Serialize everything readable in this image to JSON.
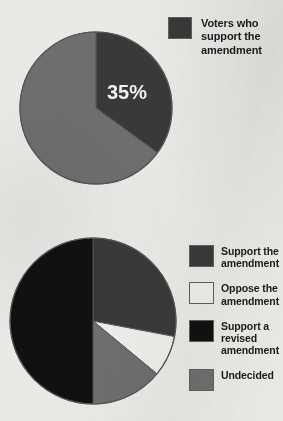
{
  "page": {
    "background_color": "#e9e9e6",
    "width": 283,
    "height": 421
  },
  "palette": {
    "dark_gray": "#393939",
    "mid_gray": "#6e6e6e",
    "near_black": "#111111",
    "off_white": "#ededea",
    "stroke": "#55555a",
    "label_text": "#f2f2f0",
    "legend_text": "#1b1b1b"
  },
  "charts": [
    {
      "id": "top",
      "type": "pie",
      "title": "",
      "center": {
        "x": 96,
        "y": 108
      },
      "radius": 77,
      "start_angle_deg": 0,
      "data_labels": [
        {
          "text": "35%",
          "slice": 0,
          "x": 127,
          "y": 92
        }
      ],
      "slices": [
        {
          "label": "Voters who support the amendment",
          "value": 35,
          "color": "#393939"
        },
        {
          "label": "",
          "value": 65,
          "color": "#6e6e6e"
        }
      ],
      "legend": {
        "position": "right-top",
        "entries": [
          {
            "label": "Voters who\nsupport the\namendment",
            "color": "#393939"
          }
        ]
      }
    },
    {
      "id": "bottom",
      "type": "pie",
      "title": "",
      "center": {
        "x": 93,
        "y": 321
      },
      "radius": 83,
      "start_angle_deg": 0,
      "data_labels": [],
      "slices": [
        {
          "label": "Support the amendment",
          "value": 28,
          "color": "#393939"
        },
        {
          "label": "Oppose the amendment",
          "value": 8,
          "color": "#ededea"
        },
        {
          "label": "Undecided",
          "value": 14,
          "color": "#6e6e6e"
        },
        {
          "label": "Support a revised amendment",
          "value": 50,
          "color": "#111111"
        }
      ],
      "legend": {
        "position": "right-bottom",
        "entries": [
          {
            "label": "Support the\namendment",
            "color": "#393939"
          },
          {
            "label": "Oppose the\namendment",
            "color": "#ededea"
          },
          {
            "label": "Support a\nrevised\namendment",
            "color": "#111111"
          },
          {
            "label": "Undecided",
            "color": "#6e6e6e"
          }
        ]
      }
    }
  ],
  "chart_data": [
    {
      "type": "pie",
      "id": "top-pie",
      "title": "Voters who support the amendment",
      "categories": [
        "Voters who support the amendment",
        "Other"
      ],
      "values": [
        35,
        65
      ],
      "value_unit": "%",
      "labels_shown": [
        "35%"
      ],
      "colors": [
        "#393939",
        "#6e6e6e"
      ],
      "legend": [
        "Voters who support the amendment"
      ],
      "legend_position": "top-right",
      "start_angle_deg": 0,
      "direction": "clockwise"
    },
    {
      "type": "pie",
      "id": "bottom-pie",
      "title": "",
      "categories": [
        "Support the amendment",
        "Oppose the amendment",
        "Undecided",
        "Support a revised amendment"
      ],
      "values": [
        28,
        8,
        14,
        50
      ],
      "value_unit": "%",
      "labels_shown": [],
      "colors": [
        "#393939",
        "#ededea",
        "#6e6e6e",
        "#111111"
      ],
      "legend": [
        "Support the amendment",
        "Oppose the amendment",
        "Support a revised amendment",
        "Undecided"
      ],
      "legend_position": "bottom-right",
      "start_angle_deg": 0,
      "direction": "clockwise"
    }
  ]
}
